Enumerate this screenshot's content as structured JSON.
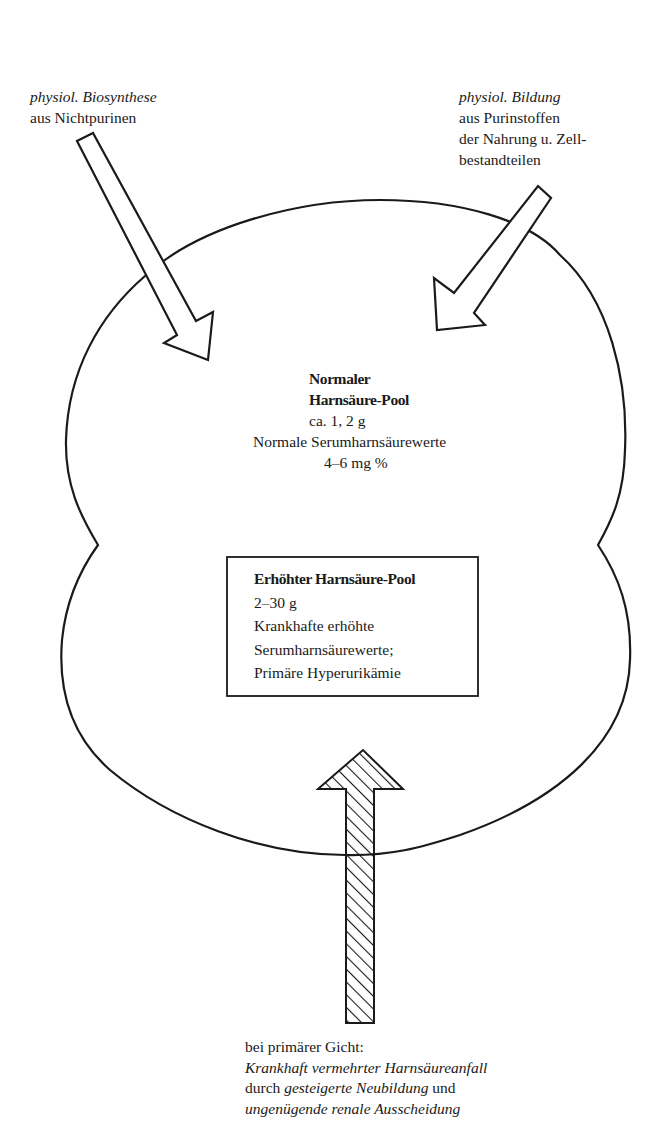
{
  "diagram": {
    "type": "flow-diagram",
    "language": "de",
    "colors": {
      "stroke": "#1a1a1a",
      "background": "#ffffff",
      "fill": "#ffffff"
    }
  },
  "inputs": {
    "left": {
      "line1": "physiol. Biosynthese",
      "line2": "aus Nichtpurinen",
      "arrow": "outline-arrow-down-right"
    },
    "right": {
      "line1": "physiol. Bildung",
      "line2": "aus Purinstoffen",
      "line3": "der Nahrung u. Zell-",
      "line4": "bestandteilen",
      "arrow": "outline-arrow-down-left"
    }
  },
  "pool": {
    "normal": {
      "title1": "Normaler",
      "title2": "Harnsäure-Pool",
      "amount": "ca. 1, 2 g",
      "serum_label": "Normale Serumharnsäurewerte",
      "serum_value": "4–6 mg %"
    },
    "elevated": {
      "title": "Erhöhter Harnsäure-Pool",
      "amount": "2–30 g",
      "line3": "Krankhafte erhöhte",
      "line4": "Serumharnsäurewerte;",
      "line5": "Primäre Hyperurikämie"
    }
  },
  "gout_input": {
    "arrow": "hatched-arrow-up",
    "line1": "bei primärer Gicht:",
    "line2": "Krankhaft vermehrter Harnsäureanfall",
    "line3_prefix": "durch ",
    "line3_italic": "gesteigerte Neubildung",
    "line3_suffix": " und",
    "line4": "ungenügende renale Ausscheidung"
  }
}
